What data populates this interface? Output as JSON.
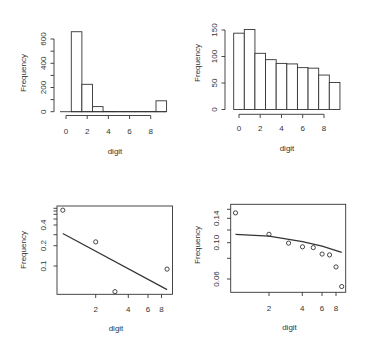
{
  "chart_data": [
    {
      "id": "top-left",
      "type": "bar",
      "subtype": "histogram",
      "title": "",
      "xlabel": "digit",
      "ylabel": "Frequency",
      "categories": [
        1,
        2,
        3,
        4,
        5,
        6,
        7,
        8,
        9
      ],
      "values": [
        660,
        226,
        42,
        2,
        1,
        1,
        1,
        1,
        90
      ],
      "bin_edges": [
        0.5,
        1.5,
        2.5,
        3.5,
        4.5,
        5.5,
        6.5,
        7.5,
        8.5,
        9.5
      ],
      "xticks": [
        0,
        2,
        4,
        6,
        8
      ],
      "yticks": [
        0,
        200,
        400,
        600
      ],
      "yticks_minor": [
        100,
        300,
        500
      ],
      "xlim": [
        0,
        9.5
      ],
      "ylim": [
        0,
        680
      ],
      "grid": false,
      "legend": null
    },
    {
      "id": "top-right",
      "type": "bar",
      "subtype": "histogram",
      "title": "",
      "xlabel": "digit",
      "ylabel": "Frequency",
      "categories": [
        0,
        1,
        2,
        3,
        4,
        5,
        6,
        7,
        8,
        9
      ],
      "values": [
        144,
        151,
        106,
        94,
        87,
        86,
        79,
        78,
        65,
        51
      ],
      "bin_edges": [
        -0.5,
        0.5,
        1.5,
        2.5,
        3.5,
        4.5,
        5.5,
        6.5,
        7.5,
        8.5,
        9.5
      ],
      "xticks": [
        0,
        2,
        4,
        6,
        8
      ],
      "yticks": [
        0,
        50,
        100,
        150
      ],
      "ylim": [
        0,
        155
      ],
      "grid": false,
      "legend": null
    },
    {
      "id": "bottom-left",
      "type": "scatter",
      "title": "",
      "xlabel": "digit",
      "ylabel": "Frequency",
      "log_x": true,
      "log_y": true,
      "points": [
        {
          "x": 1,
          "y": 0.66
        },
        {
          "x": 2,
          "y": 0.226
        },
        {
          "x": 3,
          "y": 0.042
        },
        {
          "x": 9,
          "y": 0.09
        }
      ],
      "fit_line": [
        {
          "x": 1,
          "y": 0.3
        },
        {
          "x": 9,
          "y": 0.045
        }
      ],
      "xticks": [
        2,
        4,
        6,
        8
      ],
      "yticks": [
        0.1,
        0.2,
        0.4
      ],
      "yticks_minor": [
        0.3,
        0.5,
        0.6,
        0.7,
        0.8
      ],
      "grid": false,
      "legend": null
    },
    {
      "id": "bottom-right",
      "type": "scatter",
      "title": "",
      "xlabel": "digit",
      "ylabel": "Frequency",
      "log_x": true,
      "log_y": true,
      "points": [
        {
          "x": 1,
          "y": 0.151
        },
        {
          "x": 2,
          "y": 0.112
        },
        {
          "x": 3,
          "y": 0.099
        },
        {
          "x": 4,
          "y": 0.094
        },
        {
          "x": 5,
          "y": 0.093
        },
        {
          "x": 6,
          "y": 0.085
        },
        {
          "x": 7,
          "y": 0.084
        },
        {
          "x": 8,
          "y": 0.071
        },
        {
          "x": 9,
          "y": 0.054
        }
      ],
      "fit_line": [
        {
          "x": 1,
          "y": 0.112
        },
        {
          "x": 2,
          "y": 0.109
        },
        {
          "x": 4,
          "y": 0.101
        },
        {
          "x": 6,
          "y": 0.095
        },
        {
          "x": 9,
          "y": 0.087
        }
      ],
      "xticks": [
        2,
        4,
        6,
        8
      ],
      "yticks": [
        0.06,
        0.1,
        0.14
      ],
      "yticks_minor": [
        0.08,
        0.12,
        0.16
      ],
      "grid": false,
      "legend": null
    }
  ],
  "panels": {
    "top_left": {
      "xlabel": "digit",
      "ylabel": "Frequency",
      "xtick_labels": [
        "0",
        "2",
        "4",
        "6",
        "8"
      ],
      "ytick_labels": [
        "0",
        "200",
        "400",
        "600"
      ]
    },
    "top_right": {
      "xlabel": "digit",
      "ylabel": "Frequency",
      "xtick_labels": [
        "0",
        "2",
        "4",
        "6",
        "8"
      ],
      "ytick_labels": [
        "0",
        "50",
        "100",
        "150"
      ]
    },
    "bottom_left": {
      "xlabel": "digit",
      "ylabel": "Frequency",
      "xtick_labels": [
        "2",
        "4",
        "6",
        "8"
      ],
      "ytick_labels": [
        "0.1",
        "0.2",
        "0.4"
      ]
    },
    "bottom_right": {
      "xlabel": "digit",
      "ylabel": "Frequency",
      "xtick_labels": [
        "2",
        "4",
        "6",
        "8"
      ],
      "ytick_labels": [
        "0.06",
        "0.10",
        "0.14"
      ]
    }
  },
  "colors": {
    "ink": "#333333",
    "background": "#ffffff"
  }
}
